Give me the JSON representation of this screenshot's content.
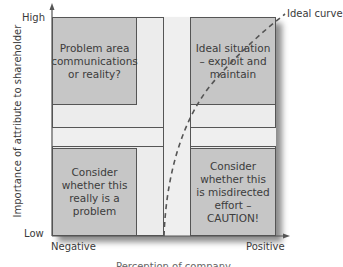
{
  "axes": {
    "y_label": "Importance of attribute to shareholder",
    "y_high": "High",
    "y_low": "Low",
    "x_negative": "Negative",
    "x_positive": "Positive",
    "x_label_partial": "Perception of company"
  },
  "quadrants": {
    "top_left": "Problem area communications or reality?",
    "top_right": "Ideal situation – exploit and maintain",
    "bottom_left": "Consider whether this really is a problem",
    "bottom_right": "Consider whether this is misdirected effort – CAUTION!"
  },
  "curve": {
    "label": "Ideal curve",
    "style": "dashed"
  },
  "colors": {
    "quadrant_fill": "#c6c6c6",
    "background_fill": "#ececec",
    "line": "#555555"
  }
}
